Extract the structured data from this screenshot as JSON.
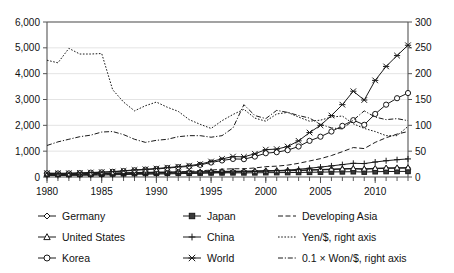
{
  "chart_data": {
    "type": "line",
    "title": "",
    "xlabel": "",
    "ylabel": "",
    "y2label": "",
    "grid": true,
    "legend_position": "bottom",
    "x": [
      1980,
      1981,
      1982,
      1983,
      1984,
      1985,
      1986,
      1987,
      1988,
      1989,
      1990,
      1991,
      1992,
      1993,
      1994,
      1995,
      1996,
      1997,
      1998,
      1999,
      2000,
      2001,
      2002,
      2003,
      2004,
      2005,
      2006,
      2007,
      2008,
      2009,
      2010,
      2011,
      2012,
      2013
    ],
    "xlim": [
      1980,
      2013
    ],
    "ylim": [
      0,
      6000
    ],
    "y2lim": [
      0,
      300
    ],
    "ytick_labels": [
      "0",
      "1,000",
      "2,000",
      "3,000",
      "4,000",
      "5,000",
      "6,000"
    ],
    "ytick_values": [
      0,
      1000,
      2000,
      3000,
      4000,
      5000,
      6000
    ],
    "y2tick_labels": [
      "0",
      "50",
      "100",
      "150",
      "200",
      "250",
      "300"
    ],
    "y2tick_values": [
      0,
      50,
      100,
      150,
      200,
      250,
      300
    ],
    "xtick_labels": [
      "1980",
      "1985",
      "1990",
      "1995",
      "2000",
      "2005",
      "2010"
    ],
    "xtick_values": [
      1980,
      1985,
      1990,
      1995,
      2000,
      2005,
      2010
    ],
    "series": [
      {
        "name": "Germany",
        "axis": "left",
        "marker": "diamond",
        "dash": "solid",
        "values": [
          120,
          115,
          112,
          118,
          122,
          130,
          140,
          150,
          160,
          168,
          175,
          180,
          185,
          182,
          190,
          200,
          205,
          210,
          215,
          220,
          230,
          235,
          240,
          250,
          265,
          275,
          290,
          305,
          315,
          300,
          320,
          335,
          340,
          345
        ]
      },
      {
        "name": "Japan",
        "axis": "left",
        "marker": "square",
        "dash": "solid",
        "values": [
          100,
          98,
          96,
          100,
          105,
          110,
          118,
          125,
          132,
          140,
          145,
          148,
          150,
          148,
          152,
          158,
          160,
          162,
          160,
          162,
          168,
          170,
          172,
          176,
          182,
          188,
          195,
          200,
          205,
          190,
          205,
          212,
          215,
          218
        ]
      },
      {
        "name": "United States",
        "axis": "left",
        "marker": "triangle",
        "dash": "solid",
        "values": [
          130,
          126,
          124,
          128,
          134,
          142,
          152,
          162,
          172,
          180,
          188,
          192,
          196,
          194,
          202,
          212,
          218,
          224,
          228,
          234,
          244,
          248,
          252,
          262,
          278,
          290,
          305,
          320,
          332,
          315,
          338,
          352,
          358,
          362
        ]
      },
      {
        "name": "China",
        "axis": "left",
        "marker": "plus",
        "dash": "solid",
        "values": [
          60,
          58,
          60,
          64,
          70,
          78,
          86,
          95,
          104,
          110,
          116,
          122,
          130,
          138,
          150,
          165,
          178,
          190,
          198,
          212,
          230,
          248,
          268,
          300,
          340,
          385,
          430,
          480,
          530,
          520,
          580,
          630,
          670,
          700
        ]
      },
      {
        "name": "Korea",
        "axis": "left",
        "marker": "circle",
        "dash": "solid",
        "values": [
          140,
          135,
          138,
          150,
          168,
          180,
          200,
          230,
          260,
          285,
          310,
          345,
          380,
          410,
          470,
          560,
          640,
          700,
          690,
          790,
          920,
          960,
          1040,
          1180,
          1400,
          1560,
          1760,
          1980,
          2200,
          2020,
          2440,
          2800,
          3050,
          3250
        ]
      },
      {
        "name": "World",
        "axis": "left",
        "marker": "star",
        "dash": "solid",
        "values": [
          150,
          145,
          148,
          160,
          175,
          190,
          210,
          240,
          275,
          300,
          330,
          365,
          400,
          440,
          500,
          600,
          700,
          790,
          780,
          900,
          1060,
          1080,
          1180,
          1400,
          1720,
          2000,
          2380,
          2800,
          3320,
          2980,
          3740,
          4280,
          4700,
          5100
        ]
      },
      {
        "name": "Developing Asia",
        "axis": "left",
        "marker": "none",
        "dash": "dashed",
        "values": [
          90,
          88,
          90,
          95,
          100,
          108,
          118,
          130,
          142,
          152,
          164,
          178,
          196,
          216,
          240,
          268,
          300,
          320,
          318,
          350,
          400,
          420,
          460,
          530,
          620,
          710,
          830,
          980,
          1140,
          1100,
          1340,
          1520,
          1660,
          1760
        ]
      },
      {
        "name": "Yen/$, right axis",
        "axis": "right",
        "marker": "none",
        "dash": "dotted",
        "values": [
          226,
          221,
          249,
          238,
          238,
          239,
          169,
          145,
          128,
          138,
          145,
          135,
          127,
          111,
          102,
          94,
          109,
          121,
          131,
          114,
          108,
          122,
          125,
          116,
          108,
          110,
          116,
          118,
          103,
          94,
          88,
          80,
          80,
          98
        ]
      },
      {
        "name": "0.1 x Won/$, right axis",
        "axis": "right",
        "marker": "none",
        "dash": "dashdot",
        "values": [
          61,
          68,
          73,
          78,
          81,
          87,
          88,
          82,
          73,
          67,
          71,
          73,
          78,
          80,
          80,
          77,
          80,
          95,
          140,
          119,
          113,
          129,
          125,
          119,
          114,
          102,
          95,
          93,
          110,
          128,
          116,
          111,
          113,
          109
        ]
      }
    ]
  },
  "legend": {
    "entries": [
      {
        "label": "Germany",
        "marker": "diamond",
        "dash": "solid"
      },
      {
        "label": "Japan",
        "marker": "square",
        "dash": "solid"
      },
      {
        "label": "Developing Asia",
        "marker": "none",
        "dash": "dashed"
      },
      {
        "label": "United States",
        "marker": "triangle",
        "dash": "solid"
      },
      {
        "label": "China",
        "marker": "plus",
        "dash": "solid"
      },
      {
        "label": "Yen/$, right axis",
        "marker": "none",
        "dash": "dotted"
      },
      {
        "label": "Korea",
        "marker": "circle",
        "dash": "solid"
      },
      {
        "label": "World",
        "marker": "star",
        "dash": "solid"
      },
      {
        "label": "0.1 × Won/$, right axis",
        "marker": "none",
        "dash": "dashdot"
      }
    ]
  },
  "colors": {
    "ink": "#1a1a1a",
    "axis": "#555555",
    "grid": "#d8d8d8",
    "background": "#ffffff",
    "marker_fill": "#ffffff",
    "marker_fill_solid": "#3a3a3a"
  }
}
